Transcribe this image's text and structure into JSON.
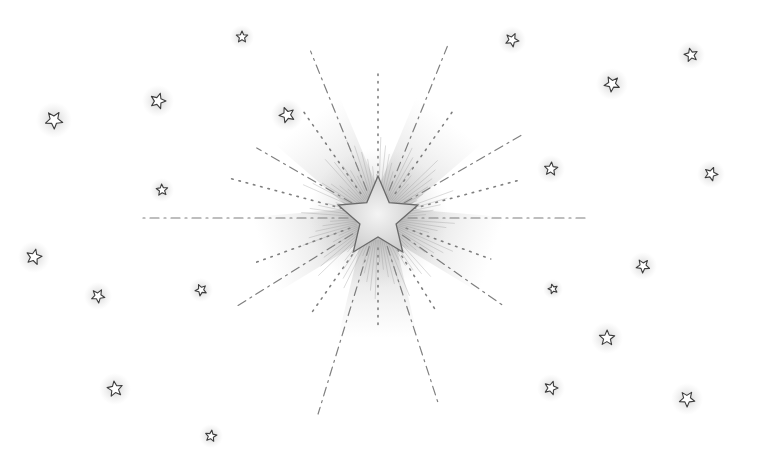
{
  "scene": {
    "title": "Pencil drawing of a radiant star surrounded by small stars",
    "background": "#ffffff",
    "stroke_color": "#555555",
    "glow_color": "#9a9a9a",
    "center_star": {
      "cx": 378,
      "cy": 218,
      "outer_r": 42,
      "inner_r": 19
    },
    "burst_rays": [
      {
        "angle": -112,
        "len": 180,
        "style": "dash"
      },
      {
        "angle": -68,
        "len": 185,
        "style": "dash"
      },
      {
        "angle": -90,
        "len": 150,
        "style": "dot"
      },
      {
        "angle": -125,
        "len": 130,
        "style": "dot"
      },
      {
        "angle": -55,
        "len": 130,
        "style": "dot"
      },
      {
        "angle": -150,
        "len": 140,
        "style": "dash"
      },
      {
        "angle": -30,
        "len": 165,
        "style": "dash"
      },
      {
        "angle": -165,
        "len": 155,
        "style": "dot"
      },
      {
        "angle": -15,
        "len": 150,
        "style": "dot"
      },
      {
        "angle": 180,
        "len": 235,
        "style": "dash"
      },
      {
        "angle": 0,
        "len": 210,
        "style": "dash"
      },
      {
        "angle": 160,
        "len": 130,
        "style": "dot"
      },
      {
        "angle": 20,
        "len": 120,
        "style": "dot"
      },
      {
        "angle": 148,
        "len": 170,
        "style": "dash"
      },
      {
        "angle": 35,
        "len": 155,
        "style": "dash"
      },
      {
        "angle": 125,
        "len": 120,
        "style": "dot"
      },
      {
        "angle": 58,
        "len": 110,
        "style": "dot"
      },
      {
        "angle": 107,
        "len": 205,
        "style": "dash"
      },
      {
        "angle": 72,
        "len": 195,
        "style": "dash"
      },
      {
        "angle": 90,
        "len": 110,
        "style": "dot"
      }
    ],
    "small_stars": [
      {
        "x": 242,
        "y": 37,
        "r": 6
      },
      {
        "x": 158,
        "y": 101,
        "r": 8
      },
      {
        "x": 54,
        "y": 120,
        "r": 9
      },
      {
        "x": 287,
        "y": 115,
        "r": 8
      },
      {
        "x": 162,
        "y": 190,
        "r": 6
      },
      {
        "x": 34,
        "y": 257,
        "r": 8
      },
      {
        "x": 98,
        "y": 296,
        "r": 7
      },
      {
        "x": 201,
        "y": 290,
        "r": 6
      },
      {
        "x": 115,
        "y": 389,
        "r": 8
      },
      {
        "x": 211,
        "y": 436,
        "r": 6
      },
      {
        "x": 512,
        "y": 40,
        "r": 7
      },
      {
        "x": 612,
        "y": 84,
        "r": 8
      },
      {
        "x": 691,
        "y": 55,
        "r": 7
      },
      {
        "x": 551,
        "y": 169,
        "r": 7
      },
      {
        "x": 711,
        "y": 174,
        "r": 7
      },
      {
        "x": 643,
        "y": 266,
        "r": 7
      },
      {
        "x": 553,
        "y": 289,
        "r": 5
      },
      {
        "x": 607,
        "y": 338,
        "r": 8
      },
      {
        "x": 551,
        "y": 388,
        "r": 7
      },
      {
        "x": 687,
        "y": 399,
        "r": 8
      }
    ]
  }
}
